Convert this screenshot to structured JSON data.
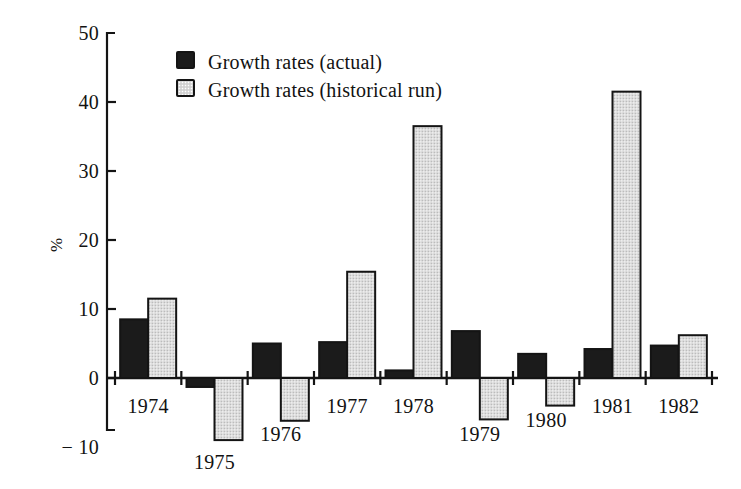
{
  "chart_data": {
    "type": "bar",
    "title": "",
    "subtitle": "",
    "xlabel": "",
    "ylabel": "%",
    "categories": [
      "1974",
      "1975",
      "1976",
      "1977",
      "1978",
      "1979",
      "1980",
      "1981",
      "1982"
    ],
    "series": [
      {
        "name": "Growth rates (actual)",
        "color": "#1b1b1b",
        "values": [
          8.5,
          -1.3,
          5.0,
          5.2,
          1.1,
          6.8,
          3.5,
          4.2,
          4.7
        ]
      },
      {
        "name": "Growth rates (historical run)",
        "color": "#dcdcdc",
        "values": [
          11.5,
          -9.0,
          -6.2,
          15.4,
          36.5,
          -6.0,
          -4.0,
          41.5,
          6.2
        ]
      }
    ],
    "ylim": [
      -10,
      50
    ],
    "yticks": [
      -10,
      0,
      10,
      20,
      30,
      40,
      50
    ],
    "ytick_labels": [
      "− 10",
      "0",
      "10",
      "20",
      "30",
      "40",
      "50"
    ],
    "grid": false,
    "legend_position": "top-left-inside"
  },
  "legend": {
    "items": [
      {
        "swatch": "solid",
        "label": "Growth rates (actual)"
      },
      {
        "swatch": "hatch",
        "label": "Growth rates (historical run)"
      }
    ]
  },
  "axis": {
    "y_title": "%",
    "y_ticks": [
      {
        "value": 50,
        "label": "50"
      },
      {
        "value": 40,
        "label": "40"
      },
      {
        "value": 30,
        "label": "30"
      },
      {
        "value": 20,
        "label": "20"
      },
      {
        "value": 10,
        "label": "10"
      },
      {
        "value": 0,
        "label": "0"
      },
      {
        "value": -10,
        "label": "− 10"
      }
    ],
    "x_labels": [
      "1974",
      "1975",
      "1976",
      "1977",
      "1978",
      "1979",
      "1980",
      "1981",
      "1982"
    ]
  },
  "colors": {
    "actual": "#1b1b1b",
    "historical": "#dcdcdc",
    "outline": "#141414",
    "background": "#ffffff"
  }
}
